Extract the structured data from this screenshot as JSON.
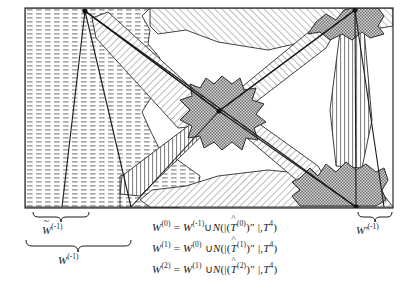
{
  "figure": {
    "title_absent": true,
    "frame": {
      "x": 25,
      "y": 8,
      "width": 368,
      "height": 200,
      "stroke": "#2b2b2b"
    },
    "vertices": [
      {
        "name": "top-left-vertex",
        "x": 85,
        "y": 11
      },
      {
        "name": "top-right-vertex",
        "x": 355,
        "y": 10
      },
      {
        "name": "center-vertex",
        "x": 219,
        "y": 111
      },
      {
        "name": "bottom-right-vertex",
        "x": 356,
        "y": 207
      }
    ],
    "fills": {
      "dashed_region": "#e9e9e9",
      "hatch_region": "#f4f4f4",
      "stipple_blob": "#8c8c8c",
      "background": "#ffffff",
      "stroke": "#2b2b2b"
    },
    "regions": [
      {
        "name": "left-dashed-region",
        "pattern": "horizontal-dash",
        "label": "W-tilde-minus-1"
      },
      {
        "name": "diagonal-hatch-bands",
        "pattern": "diagonal-hatch"
      },
      {
        "name": "center-stipple-blob",
        "pattern": "stipple"
      },
      {
        "name": "top-right-stipple-blob",
        "pattern": "stipple"
      },
      {
        "name": "bottom-right-stipple-blob",
        "pattern": "stipple"
      }
    ]
  },
  "labels": {
    "left_inner": {
      "name": "w-tilde-minus-one-label",
      "base": "W",
      "accent": "~",
      "superscript": "(-1)",
      "text": "W̃(-1)"
    },
    "left_outer": {
      "name": "w-minus-one-label",
      "base": "W",
      "superscript": "(-1)",
      "text": "W(-1)"
    },
    "right": {
      "name": "w-prime-minus-one-label",
      "base": "W′",
      "superscript": "(-1)",
      "text": "W′ (-1)"
    }
  },
  "equations": [
    {
      "name": "equation-w0",
      "lhs_base": "W",
      "lhs_sup": "(0)",
      "eq": "=",
      "rhs_base": "W",
      "rhs_sup": "(-1)",
      "union": "∪",
      "func": "N",
      "open": "(|(",
      "that_base": "T",
      "that_hat": "^",
      "that_sup": "(0)",
      "close_inner": ")″ |",
      "comma": ",",
      "t_base": "T",
      "t_sup": "4",
      "close": ")",
      "plain": "W(0) = W(-1) ∪ N(|(T̂(0))″|, T4)"
    },
    {
      "name": "equation-w1",
      "lhs_base": "W",
      "lhs_sup": "(1)",
      "eq": "=",
      "rhs_base": "W",
      "rhs_sup": "(0)",
      "union": "∪",
      "func": "N",
      "open": "(|(",
      "that_base": "T",
      "that_hat": "^",
      "that_sup": "(1)",
      "close_inner": ")″ |",
      "comma": ",",
      "t_base": "T",
      "t_sup": "4",
      "close": ")",
      "plain": "W(1) = W(0) ∪ N(|(T̂(1))″|, T4)"
    },
    {
      "name": "equation-w2",
      "lhs_base": "W",
      "lhs_sup": "(2)",
      "eq": "=",
      "rhs_base": "W",
      "rhs_sup": "(1)",
      "union": "∪",
      "func": "N",
      "open": "(|(",
      "that_base": "T",
      "that_hat": "^",
      "that_sup": "(2)",
      "close_inner": ")″ |",
      "comma": ",",
      "t_base": "T",
      "t_sup": "4",
      "close": ")",
      "plain": "W(2) = W(1) ∪ N(|(T̂(2))″|, T4)"
    }
  ]
}
